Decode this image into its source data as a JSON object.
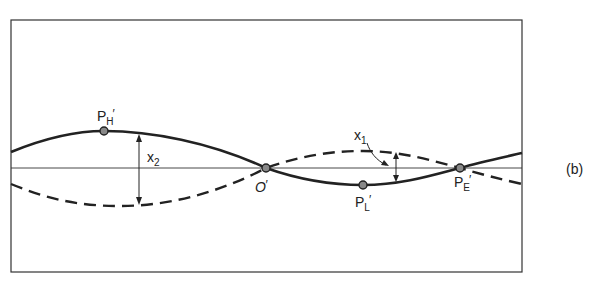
{
  "figure": {
    "panel_label": "(b)",
    "labels": {
      "ph": {
        "main": "P",
        "sub": "H",
        "prime": "′"
      },
      "o": {
        "main": "O",
        "prime": "′"
      },
      "pl": {
        "main": "P",
        "sub": "L",
        "prime": "′"
      },
      "pe": {
        "main": "P",
        "sub": "E",
        "prime": "′"
      },
      "x1": {
        "main": "x",
        "sub": "1"
      },
      "x2": {
        "main": "x",
        "sub": "2"
      }
    },
    "curves": [
      {
        "name": "solid-curve",
        "style": "solid"
      },
      {
        "name": "dashed-curve",
        "style": "dashed"
      }
    ],
    "colors": {
      "ink": "#222222",
      "background": "#ffffff"
    }
  }
}
